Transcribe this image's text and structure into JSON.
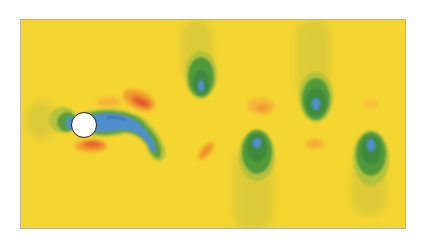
{
  "figure": {
    "colors": {
      "background": "#f5d631",
      "border": "#b8b29a",
      "positive_weak": "#f29a2e",
      "positive_strong": "#e2532a",
      "negative_weak": "#b3c23a",
      "negative_mid": "#5a9e3c",
      "negative_dark": "#3f8a3a",
      "negative_core": "#4f8fd0",
      "cylinder": "#ffffff"
    },
    "cylinder": {
      "cx": 63,
      "cy": 105,
      "r": 12
    },
    "vortices_upper": [
      {
        "cx": 180,
        "cy": 55,
        "label": "upper-vortex-1"
      },
      {
        "cx": 295,
        "cy": 78,
        "label": "upper-vortex-2"
      }
    ],
    "vortices_lower": [
      {
        "cx": 237,
        "cy": 133,
        "label": "lower-vortex-1"
      },
      {
        "cx": 350,
        "cy": 136,
        "label": "lower-vortex-2"
      }
    ]
  }
}
